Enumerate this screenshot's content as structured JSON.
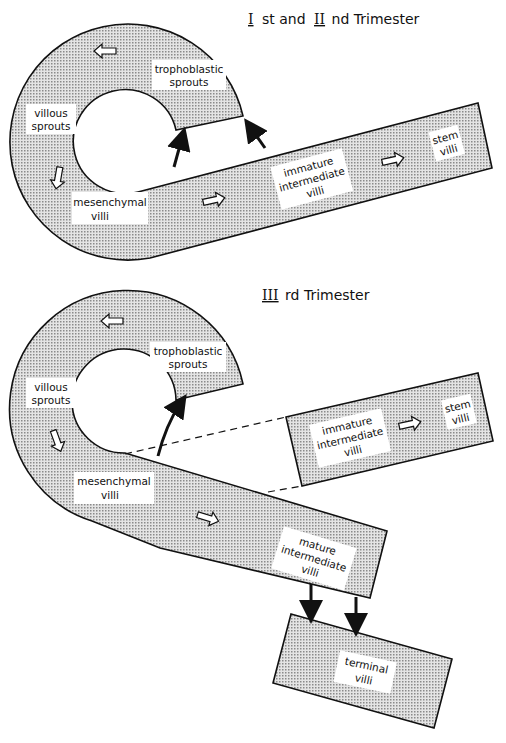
{
  "panels": [
    {
      "title_roman": "I",
      "title_mid": "st and",
      "title_roman2": "II",
      "title_rest": "nd Trimester",
      "labels": {
        "trophoblastic": [
          "trophoblastic",
          "sprouts"
        ],
        "villous": [
          "villous",
          "sprouts"
        ],
        "mesenchymal": [
          "mesenchymal",
          "villi"
        ],
        "immature": [
          "immature",
          "intermediate",
          "villi"
        ],
        "stem": [
          "stem",
          "villi"
        ]
      }
    },
    {
      "title_roman": "III",
      "title_rest": "rd Trimester",
      "labels": {
        "trophoblastic": [
          "trophoblastic",
          "sprouts"
        ],
        "villous": [
          "villous",
          "sprouts"
        ],
        "mesenchymal": [
          "mesenchymal",
          "villi"
        ],
        "immature": [
          "immature",
          "intermediate",
          "villi"
        ],
        "stem": [
          "stem",
          "villi"
        ],
        "mature": [
          "mature",
          "intermediate",
          "villi"
        ],
        "terminal": [
          "terminal",
          "villi"
        ]
      }
    }
  ],
  "colors": {
    "fill": "#cfcfcf",
    "stroke": "#111111",
    "label_bg": "#ffffff"
  }
}
